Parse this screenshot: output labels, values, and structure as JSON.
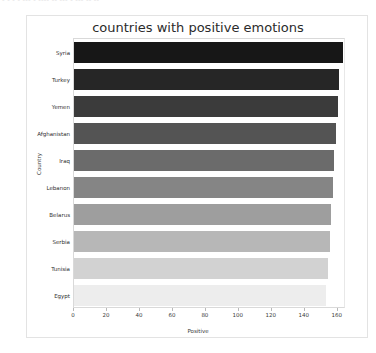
{
  "page": {
    "top_ghost_text": "- -  -  - --- -  ---- -- --- -  --- --  --"
  },
  "chart_data": {
    "type": "bar",
    "orientation": "horizontal",
    "title": "countries with positive emotions",
    "xlabel": "Positive",
    "ylabel": "Country",
    "categories": [
      "Syria",
      "Turkey",
      "Yemen",
      "Afghanistan",
      "Iraq",
      "Lebanon",
      "Belarus",
      "Serbia",
      "Tunisia",
      "Egypt"
    ],
    "values": [
      163,
      161,
      160,
      159,
      158,
      157,
      156,
      155,
      154,
      153
    ],
    "colors": [
      "#171717",
      "#262626",
      "#3b3b3b",
      "#545454",
      "#6b6b6b",
      "#858585",
      "#9e9e9e",
      "#b7b7b7",
      "#d2d2d2",
      "#ededed"
    ],
    "xlim": [
      0,
      165
    ],
    "xticks": [
      0,
      20,
      40,
      60,
      80,
      100,
      120,
      140,
      160
    ],
    "xticklabels": [
      "0",
      "20",
      "40",
      "60",
      "80",
      "100",
      "120",
      "140",
      "160"
    ],
    "grid": false,
    "legend": false,
    "background": "#ffffff",
    "axis_color": "#d9d9d9"
  }
}
